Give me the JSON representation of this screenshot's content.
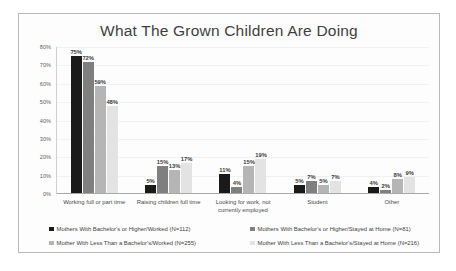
{
  "chart_data": {
    "type": "bar",
    "title": "What The Grown Children Are Doing",
    "xlabel": "",
    "ylabel": "",
    "ylim": [
      0,
      80
    ],
    "ytick_labels": [
      "80%",
      "70%",
      "60%",
      "50%",
      "40%",
      "30%",
      "20%",
      "10%",
      "0%"
    ],
    "ytick_values": [
      80,
      70,
      60,
      50,
      40,
      30,
      20,
      10,
      0
    ],
    "grid": true,
    "legend_position": "bottom",
    "categories": [
      "Working full or part time",
      "Raising children full time",
      "Looking for work, not currently employed",
      "Student",
      "Other"
    ],
    "series": [
      {
        "name": "Mothers With Bachelor's or Higher/Worked (N=112)",
        "color": "#1a1a1a",
        "values": [
          75,
          5,
          11,
          5,
          4
        ],
        "labels": [
          "75%",
          "5%",
          "11%",
          "5%",
          "4%"
        ]
      },
      {
        "name": "Mothers With Bachelor's or Higher/Stayed at Home (N=81)",
        "color": "#7f7f7f",
        "values": [
          72,
          15,
          4,
          7,
          2
        ],
        "labels": [
          "72%",
          "15%",
          "4%",
          "7%",
          "2%"
        ]
      },
      {
        "name": "Mother With Less Than a Bachelor's/Worked (N=255)",
        "color": "#b5b5b5",
        "values": [
          59,
          13,
          15,
          5,
          8
        ],
        "labels": [
          "59%",
          "13%",
          "15%",
          "5%",
          "8%"
        ]
      },
      {
        "name": "Mother With Less Than a Bachelor's/Stayed at Home (N=216)",
        "color": "#e3e3e3",
        "values": [
          48,
          17,
          19,
          7,
          9
        ],
        "labels": [
          "48%",
          "17%",
          "19%",
          "7%",
          "9%"
        ]
      }
    ]
  }
}
